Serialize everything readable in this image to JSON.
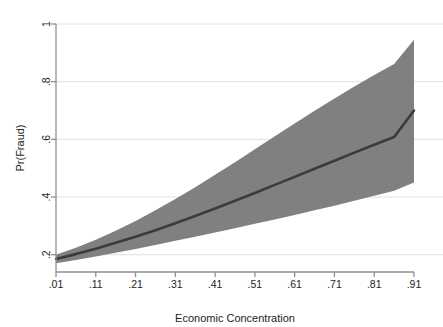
{
  "chart_data": {
    "type": "area",
    "title": "",
    "subtitle": "",
    "xlabel": "Economic Concentration",
    "ylabel": "Pr(Fraud)",
    "xlim": [
      0.01,
      0.91
    ],
    "ylim": [
      0.14,
      1.0
    ],
    "grid": true,
    "legend_position": "none",
    "xtick_labels": [
      ".01",
      ".11",
      ".21",
      ".31",
      ".41",
      ".51",
      ".61",
      ".71",
      ".81",
      ".91"
    ],
    "xtick_values": [
      0.01,
      0.11,
      0.21,
      0.31,
      0.41,
      0.51,
      0.61,
      0.71,
      0.81,
      0.91
    ],
    "ytick_labels": [
      ".2",
      ".4",
      ".6",
      ".8",
      "1"
    ],
    "ytick_values": [
      0.2,
      0.4,
      0.6,
      0.8,
      1.0
    ],
    "x": [
      0.01,
      0.06,
      0.11,
      0.16,
      0.21,
      0.26,
      0.31,
      0.36,
      0.41,
      0.46,
      0.51,
      0.56,
      0.61,
      0.66,
      0.71,
      0.76,
      0.81,
      0.86,
      0.91
    ],
    "series": [
      {
        "name": "Predicted probability",
        "role": "fit",
        "color": "#3b3b3b",
        "values": [
          0.185,
          0.202,
          0.221,
          0.241,
          0.262,
          0.285,
          0.309,
          0.334,
          0.36,
          0.387,
          0.414,
          0.442,
          0.47,
          0.498,
          0.526,
          0.554,
          0.581,
          0.608,
          0.7
        ]
      },
      {
        "name": "95% confidence interval upper",
        "role": "ci_upper",
        "color": "#808080",
        "values": [
          0.2,
          0.224,
          0.252,
          0.283,
          0.317,
          0.354,
          0.393,
          0.434,
          0.477,
          0.521,
          0.566,
          0.611,
          0.655,
          0.699,
          0.742,
          0.783,
          0.823,
          0.861,
          0.945
        ]
      },
      {
        "name": "95% confidence interval lower",
        "role": "ci_lower",
        "color": "#808080",
        "values": [
          0.17,
          0.182,
          0.194,
          0.207,
          0.22,
          0.234,
          0.248,
          0.262,
          0.277,
          0.292,
          0.307,
          0.322,
          0.338,
          0.354,
          0.37,
          0.387,
          0.404,
          0.422,
          0.45
        ]
      }
    ],
    "colors": {
      "band": "#808080",
      "line": "#3b3b3b",
      "grid": "#d9dde2",
      "axis": "#8c9199",
      "text": "#1d1d1d",
      "background": "#ffffff"
    }
  }
}
